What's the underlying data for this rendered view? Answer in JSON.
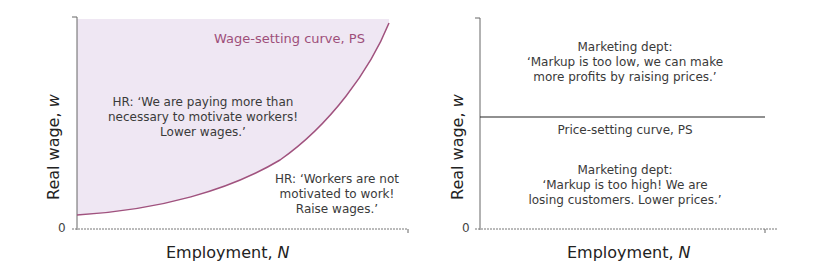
{
  "chart_data": [
    {
      "type": "line",
      "title": "",
      "xlabel": "Employment, N",
      "ylabel": "Real wage, w",
      "y_origin_label": "0",
      "series": [
        {
          "name": "Wage-setting curve, PS",
          "color": "#a0527e",
          "shape": "convex increasing",
          "points": [
            [
              0,
              0.07
            ],
            [
              0.4,
              0.16
            ],
            [
              0.65,
              0.33
            ],
            [
              0.85,
              0.56
            ],
            [
              1.0,
              0.97
            ]
          ]
        }
      ],
      "shaded_region": {
        "description": "area above the wage-setting curve",
        "color": "#efe7f3"
      },
      "annotations": [
        "HR: 'We are paying more than necessary to motivate workers! Lower wages.'",
        "HR: 'Workers are not motivated to work! Raise wages.'"
      ]
    },
    {
      "type": "line",
      "title": "",
      "xlabel": "Employment, N",
      "ylabel": "Real wage, w",
      "y_origin_label": "0",
      "series": [
        {
          "name": "Price-setting curve, PS",
          "color": "#222222",
          "shape": "horizontal",
          "points": [
            [
              0,
              0.53
            ],
            [
              1,
              0.53
            ]
          ]
        }
      ],
      "annotations": [
        "Marketing dept: 'Markup is too low, we can make more profits by raising prices.'",
        "Marketing dept: 'Markup is too high! We are losing customers. Lower prices.'"
      ]
    }
  ],
  "left": {
    "ylabel": "Real wage, w",
    "xlabel": "Employment, N",
    "zero": "0",
    "curve_label": "Wage-setting curve, PS",
    "upper_note": [
      "HR: ‘We are paying more than",
      "necessary to motivate workers!",
      "Lower wages.’"
    ],
    "lower_note": [
      "HR: ‘Workers are not",
      "motivated to work!",
      "Raise wages.’"
    ]
  },
  "right": {
    "ylabel": "Real wage, w",
    "xlabel": "Employment, N",
    "zero": "0",
    "curve_label": "Price-setting curve, PS",
    "upper_note": [
      "Marketing dept:",
      "‘Markup is too low, we can make",
      "more profits by raising prices.’"
    ],
    "lower_note": [
      "Marketing dept:",
      "‘Markup is too high! We are",
      "losing customers. Lower prices.’"
    ]
  }
}
